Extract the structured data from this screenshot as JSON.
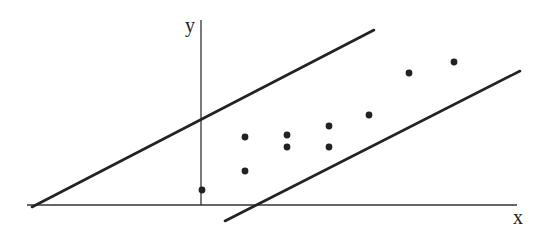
{
  "diagram": {
    "type": "scatter-with-band",
    "axes": {
      "x_label": "x",
      "y_label": "y",
      "origin": [
        201,
        205
      ],
      "x_axis": {
        "x1": 27,
        "y1": 205,
        "x2": 517,
        "y2": 205
      },
      "y_axis": {
        "x1": 201,
        "y1": 20,
        "x2": 201,
        "y2": 205
      },
      "x_label_pos": [
        513,
        224
      ],
      "y_label_pos": [
        185,
        32
      ]
    },
    "lines": [
      {
        "name": "upper-boundary-line",
        "x1": 32,
        "y1": 207,
        "x2": 374,
        "y2": 30
      },
      {
        "name": "lower-boundary-line",
        "x1": 225,
        "y1": 221,
        "x2": 520,
        "y2": 71
      }
    ],
    "points": [
      {
        "x": 202,
        "y": 190
      },
      {
        "x": 245,
        "y": 137
      },
      {
        "x": 245,
        "y": 171
      },
      {
        "x": 287,
        "y": 135
      },
      {
        "x": 287,
        "y": 147
      },
      {
        "x": 329,
        "y": 126
      },
      {
        "x": 329,
        "y": 147
      },
      {
        "x": 369,
        "y": 115
      },
      {
        "x": 409,
        "y": 73
      },
      {
        "x": 454,
        "y": 62
      }
    ],
    "colors": {
      "stroke": "#222222",
      "point": "#222222",
      "background": "#ffffff"
    }
  }
}
